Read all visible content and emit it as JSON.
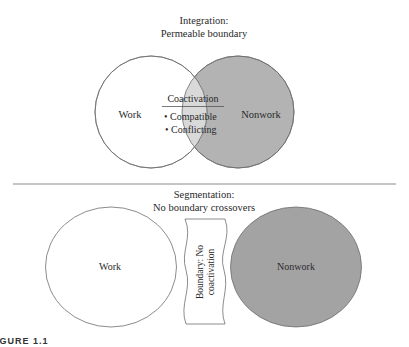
{
  "integration": {
    "title_line1": "Integration:",
    "title_line2": "Permeable boundary",
    "work_label": "Work",
    "nonwork_label": "Nonwork",
    "overlap_heading": "Coactivation",
    "overlap_items": [
      "• Compatible",
      "• Conflicting"
    ]
  },
  "segmentation": {
    "title_line1": "Segmentation:",
    "title_line2": "No boundary crossovers",
    "work_label": "Work",
    "nonwork_label": "Nonwork",
    "boundary_line1": "Boundary: No",
    "boundary_line2": "coactivation"
  },
  "caption": "IGURE 1.1",
  "colors": {
    "stroke": "#6e6e6e",
    "work_fill": "#ffffff",
    "overlap_fill": "#d9d9d9",
    "nonwork_fill_top": "#b3b3b3",
    "nonwork_fill_bottom": "#a3a3a3",
    "separator": "#8a8a8a"
  }
}
